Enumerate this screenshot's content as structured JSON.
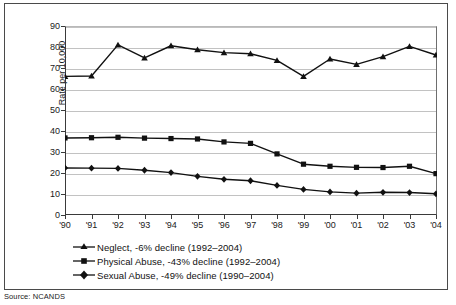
{
  "figure": {
    "source_note": "Source: NCANDS"
  },
  "chart_data": {
    "type": "line",
    "title": "",
    "xlabel": "",
    "ylabel": "Rate per 10,000",
    "ylim": [
      0,
      90
    ],
    "ytick_values": [
      0,
      10,
      20,
      30,
      40,
      50,
      60,
      70,
      80,
      90
    ],
    "ytick_labels": [
      "0",
      "10",
      "20",
      "30",
      "40",
      "50",
      "60",
      "70",
      "80",
      "90"
    ],
    "grid": true,
    "legend_position": "below-axes",
    "categories": [
      "1990",
      "1991",
      "1992",
      "1993",
      "1994",
      "1995",
      "1996",
      "1997",
      "1998",
      "1999",
      "2000",
      "2001",
      "2002",
      "2003",
      "2004"
    ],
    "xtick_labels": [
      "'90",
      "'91",
      "'92",
      "'93",
      "'94",
      "'95",
      "'96",
      "'97",
      "'98",
      "'99",
      "'00",
      "'01",
      "'02",
      "'03",
      "'04"
    ],
    "series": [
      {
        "name": "Neglect, -6% decline (1992–2004)",
        "marker": "triangle",
        "color": "#111111",
        "values": [
          66.0,
          66.2,
          81.0,
          74.8,
          80.6,
          78.7,
          77.3,
          76.8,
          73.6,
          66.0,
          74.3,
          71.7,
          75.4,
          80.3,
          76.2
        ]
      },
      {
        "name": "Physical Abuse, -43% decline (1992–2004)",
        "marker": "square",
        "color": "#111111",
        "values": [
          36.7,
          36.8,
          37.0,
          36.6,
          36.4,
          36.2,
          34.8,
          34.1,
          29.1,
          24.2,
          23.2,
          22.7,
          22.6,
          23.2,
          19.7
        ]
      },
      {
        "name": "Sexual Abuse, -49% decline (1990–2004)",
        "marker": "diamond",
        "color": "#111111",
        "values": [
          22.4,
          22.3,
          22.2,
          21.3,
          20.2,
          18.4,
          17.0,
          16.3,
          14.1,
          12.2,
          11.0,
          10.4,
          10.8,
          10.7,
          10.1
        ]
      }
    ]
  },
  "legend": {
    "items": [
      {
        "label": "Neglect, -6% decline (1992–2004)",
        "marker": "triangle"
      },
      {
        "label": "Physical Abuse, -43% decline (1992–2004)",
        "marker": "square"
      },
      {
        "label": "Sexual Abuse, -49% decline (1990–2004)",
        "marker": "diamond"
      }
    ]
  }
}
